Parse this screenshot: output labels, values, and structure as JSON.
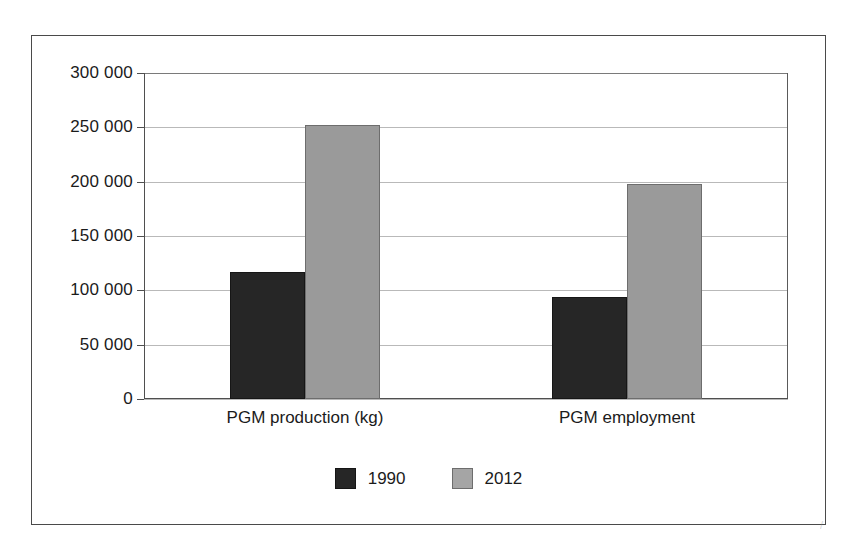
{
  "figure": {
    "background_color": "#ffffff",
    "frame_color": "#4a4a4a",
    "scan_artifact_text": "",
    "speckle_mark": "/"
  },
  "chart_data": {
    "type": "bar",
    "title": "",
    "subtitle": "",
    "xlabel": "",
    "ylabel": "",
    "categories": [
      "PGM production (kg)",
      "PGM employment"
    ],
    "series": [
      {
        "name": "1990",
        "color": "#262626",
        "values": [
          117000,
          94000
        ]
      },
      {
        "name": "2012",
        "color": "#9a9a9a",
        "values": [
          252000,
          198000
        ]
      }
    ],
    "ylim": [
      0,
      300000
    ],
    "ytick_values": [
      0,
      50000,
      100000,
      150000,
      200000,
      250000,
      300000
    ],
    "ytick_labels": [
      "0",
      "50 000",
      "100 000",
      "150 000",
      "200 000",
      "250 000",
      "300 000"
    ],
    "grid": true,
    "grid_axis": "y",
    "legend_position": "bottom",
    "legend_entries": [
      "1990",
      "2012"
    ],
    "annotations": []
  }
}
